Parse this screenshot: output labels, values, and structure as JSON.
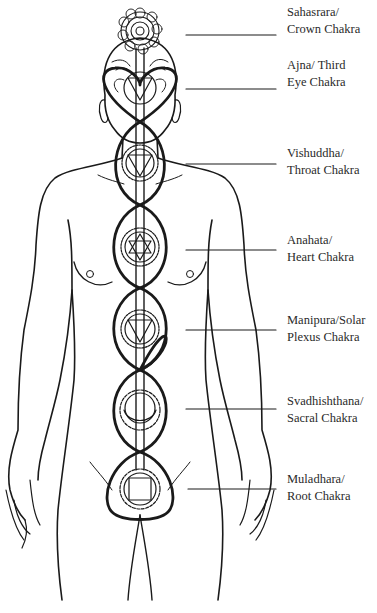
{
  "figure": {
    "line_color": "#1a1a1a",
    "background": "#ffffff"
  },
  "labels": [
    {
      "id": "sahasrara",
      "line1": "Sahasrara/",
      "line2": "Crown Chakra",
      "top": 4,
      "line_y": 35
    },
    {
      "id": "ajna",
      "line1": "Ajna/ Third",
      "line2": "Eye Chakra",
      "top": 57,
      "line_y": 89
    },
    {
      "id": "vishuddha",
      "line1": "Vishuddha/",
      "line2": "Throat Chakra",
      "top": 145,
      "line_y": 164
    },
    {
      "id": "anahata",
      "line1": "Anahata/",
      "line2": "Heart Chakra",
      "top": 232,
      "line_y": 250
    },
    {
      "id": "manipura",
      "line1": "Manipura/Solar",
      "line2": "Plexus Chakra",
      "top": 312,
      "line_y": 330
    },
    {
      "id": "svadhishthana",
      "line1": "Svadhishthana/",
      "line2": "Sacral Chakra",
      "top": 393,
      "line_y": 409
    },
    {
      "id": "muladhara",
      "line1": "Muladhara/",
      "line2": "Root Chakra",
      "top": 471,
      "line_y": 489
    }
  ],
  "chakras": [
    {
      "name": "crown",
      "symbol": "lotus",
      "cx": 140,
      "cy": 31
    },
    {
      "name": "third-eye",
      "symbol": "down-triangle",
      "cx": 140,
      "cy": 85
    },
    {
      "name": "throat",
      "symbol": "down-triangle",
      "cx": 140,
      "cy": 165
    },
    {
      "name": "heart",
      "symbol": "hexagram",
      "cx": 140,
      "cy": 247
    },
    {
      "name": "solar-plexus",
      "symbol": "down-triangle",
      "cx": 140,
      "cy": 329
    },
    {
      "name": "sacral",
      "symbol": "crescent",
      "cx": 140,
      "cy": 412
    },
    {
      "name": "root",
      "symbol": "square",
      "cx": 140,
      "cy": 489
    }
  ]
}
